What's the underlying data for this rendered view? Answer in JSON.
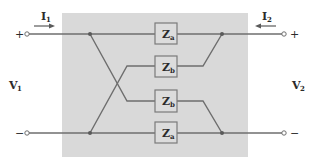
{
  "diagram": {
    "colors": {
      "background": "#ffffff",
      "network_fill": "#d9d9d9",
      "wire": "#6e6e6e",
      "box_fill": "#dcdcdc",
      "box_stroke": "#7a7a7a",
      "text": "#2b2b2b"
    },
    "port1": {
      "current_label": "I",
      "current_sub": "1",
      "voltage_label": "V",
      "voltage_sub": "1",
      "plus": "+",
      "minus": "−"
    },
    "port2": {
      "current_label": "I",
      "current_sub": "2",
      "voltage_label": "V",
      "voltage_sub": "2",
      "plus": "+",
      "minus": "−"
    },
    "impedances": [
      {
        "label": "Z",
        "sub": "a",
        "position": "top"
      },
      {
        "label": "Z",
        "sub": "b",
        "position": "upper-middle"
      },
      {
        "label": "Z",
        "sub": "b",
        "position": "lower-middle"
      },
      {
        "label": "Z",
        "sub": "a",
        "position": "bottom"
      }
    ]
  }
}
